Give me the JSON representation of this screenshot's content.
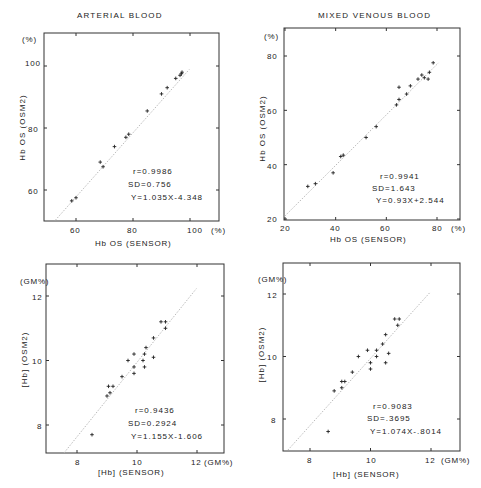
{
  "chart_data": [
    {
      "type": "scatter",
      "title": "ARTERIAL BLOOD",
      "xlabel": "Hb OS (SENSOR)",
      "ylabel": "Hb OS (OSM2)",
      "x_unit": "(%)",
      "y_unit": "(%)",
      "xticks": [
        60,
        80,
        100
      ],
      "yticks": [
        60,
        80,
        100
      ],
      "xlim": [
        50,
        105
      ],
      "ylim": [
        50,
        108
      ],
      "grid": false,
      "regression_line": {
        "slope": 1.035,
        "intercept": -4.348
      },
      "stats": {
        "r": "r=0.9986",
        "sd": "SD=0.756",
        "eq": "Y=1.035X-4.348"
      },
      "points": [
        [
          58.5,
          56.5
        ],
        [
          60,
          57.5
        ],
        [
          68.5,
          69
        ],
        [
          69.5,
          67.5
        ],
        [
          73.5,
          74
        ],
        [
          77.5,
          77
        ],
        [
          78.5,
          78
        ],
        [
          85,
          85.5
        ],
        [
          90,
          91
        ],
        [
          92,
          93
        ],
        [
          95,
          96
        ],
        [
          96.5,
          97
        ],
        [
          97,
          97.5
        ],
        [
          97.2,
          98
        ]
      ]
    },
    {
      "type": "scatter",
      "title": "MIXED VENOUS BLOOD",
      "xlabel": "Hb OS (SENSOR)",
      "ylabel": "Hb OS (OSM2)",
      "x_unit": "(%)",
      "y_unit": "(%)",
      "xticks": [
        20,
        40,
        60,
        80
      ],
      "yticks": [
        20,
        40,
        60,
        80
      ],
      "xlim": [
        20,
        90
      ],
      "ylim": [
        20,
        90
      ],
      "grid": false,
      "regression_line": {
        "slope": 0.93,
        "intercept": 2.544
      },
      "stats": {
        "r": "r=0.9941",
        "sd": "SD=1.643",
        "eq": "Y=0.93X+2.544"
      },
      "points": [
        [
          29,
          32
        ],
        [
          32,
          33
        ],
        [
          39,
          37
        ],
        [
          42,
          43
        ],
        [
          43,
          43.5
        ],
        [
          52,
          50
        ],
        [
          56,
          54
        ],
        [
          64,
          62
        ],
        [
          65,
          64
        ],
        [
          65,
          68.5
        ],
        [
          68,
          66
        ],
        [
          69.5,
          69
        ],
        [
          72.5,
          71.5
        ],
        [
          74,
          73
        ],
        [
          75,
          72
        ],
        [
          76.5,
          71.5
        ],
        [
          77,
          74
        ],
        [
          78.5,
          77.5
        ]
      ]
    },
    {
      "type": "scatter",
      "title": "",
      "xlabel": "[Hb] (SENSOR)",
      "ylabel": "[Hb] (OSM2)",
      "x_unit": "(GM%)",
      "y_unit": "(GM%)",
      "xticks": [
        8,
        10,
        12
      ],
      "yticks": [
        8,
        10,
        12
      ],
      "xlim": [
        7,
        13
      ],
      "ylim": [
        7,
        13
      ],
      "grid": false,
      "regression_line": {
        "slope": 1.155,
        "intercept": -1.606
      },
      "stats": {
        "r": "r=0.9436",
        "sd": "SD=0.2924",
        "eq": "Y=1.155X-1.606"
      },
      "points": [
        [
          8.5,
          7.7
        ],
        [
          9.0,
          8.9
        ],
        [
          9.1,
          9.0
        ],
        [
          9.05,
          9.2
        ],
        [
          9.2,
          9.2
        ],
        [
          9.5,
          9.5
        ],
        [
          9.7,
          10.0
        ],
        [
          9.9,
          9.6
        ],
        [
          9.9,
          9.8
        ],
        [
          9.9,
          10.2
        ],
        [
          10.2,
          10.0
        ],
        [
          10.25,
          9.8
        ],
        [
          10.25,
          10.2
        ],
        [
          10.3,
          10.4
        ],
        [
          10.55,
          10.1
        ],
        [
          10.55,
          10.7
        ],
        [
          10.8,
          11.2
        ],
        [
          10.95,
          11.2
        ],
        [
          10.95,
          11.0
        ]
      ]
    },
    {
      "type": "scatter",
      "title": "",
      "xlabel": "[Hb] (SENSOR)",
      "ylabel": "[Hb] (OSM2)",
      "x_unit": "(GM%)",
      "y_unit": "(GM%)",
      "xticks": [
        8,
        10,
        12
      ],
      "yticks": [
        8,
        10,
        12
      ],
      "xlim": [
        7,
        13
      ],
      "ylim": [
        7,
        13
      ],
      "grid": false,
      "regression_line": {
        "slope": 1.074,
        "intercept": -0.8014
      },
      "stats": {
        "r": "r=0.9083",
        "sd": "SD=.3695",
        "eq": "Y=1.074X-.8014"
      },
      "points": [
        [
          8.6,
          7.6
        ],
        [
          8.8,
          8.9
        ],
        [
          9.05,
          9.0
        ],
        [
          9.05,
          9.2
        ],
        [
          9.15,
          9.2
        ],
        [
          9.4,
          9.5
        ],
        [
          9.6,
          10.0
        ],
        [
          9.9,
          10.2
        ],
        [
          10.0,
          9.8
        ],
        [
          10.0,
          9.6
        ],
        [
          10.2,
          10.0
        ],
        [
          10.2,
          10.2
        ],
        [
          10.4,
          10.4
        ],
        [
          10.5,
          9.8
        ],
        [
          10.5,
          10.7
        ],
        [
          10.6,
          10.1
        ],
        [
          10.8,
          11.2
        ],
        [
          10.9,
          11.0
        ],
        [
          10.95,
          11.2
        ]
      ]
    }
  ],
  "panels": [
    {
      "title": "ARTERIAL BLOOD",
      "xlabel": "Hb OS (SENSOR)",
      "ylabel": "Hb OS (OSM2)",
      "y_unit": "(%)",
      "x_unit": "(%)",
      "xticks": [
        "60",
        "80",
        "100"
      ],
      "yticks": [
        "60",
        "80",
        "100"
      ],
      "stats": {
        "r": "r=0.9986",
        "sd": "SD=0.756",
        "eq": "Y=1.035X-4.348"
      }
    },
    {
      "title": "MIXED VENOUS BLOOD",
      "xlabel": "Hb OS (SENSOR)",
      "ylabel": "Hb OS (OSM2)",
      "y_unit": "(%)",
      "x_unit": "(%)",
      "xticks": [
        "20",
        "40",
        "60",
        "80"
      ],
      "yticks": [
        "20",
        "40",
        "60",
        "80"
      ],
      "stats": {
        "r": "r=0.9941",
        "sd": "SD=1.643",
        "eq": "Y=0.93X+2.544"
      }
    },
    {
      "title": "",
      "xlabel": "[Hb] (SENSOR)",
      "ylabel": "[Hb] (OSM2)",
      "y_unit": "(GM%)",
      "x_unit": "(GM%)",
      "xticks": [
        "8",
        "10",
        "12"
      ],
      "yticks": [
        "8",
        "10",
        "12"
      ],
      "stats": {
        "r": "r=0.9436",
        "sd": "SD=0.2924",
        "eq": "Y=1.155X-1.606"
      }
    },
    {
      "title": "",
      "xlabel": "[Hb] (SENSOR)",
      "ylabel": "[Hb] (OSM2)",
      "y_unit": "(GM%)",
      "x_unit": "(GM%)",
      "xticks": [
        "8",
        "10",
        "12"
      ],
      "yticks": [
        "8",
        "10",
        "12"
      ],
      "stats": {
        "r": "r=0.9083",
        "sd": "SD=.3695",
        "eq": "Y=1.074X-.8014"
      }
    }
  ]
}
